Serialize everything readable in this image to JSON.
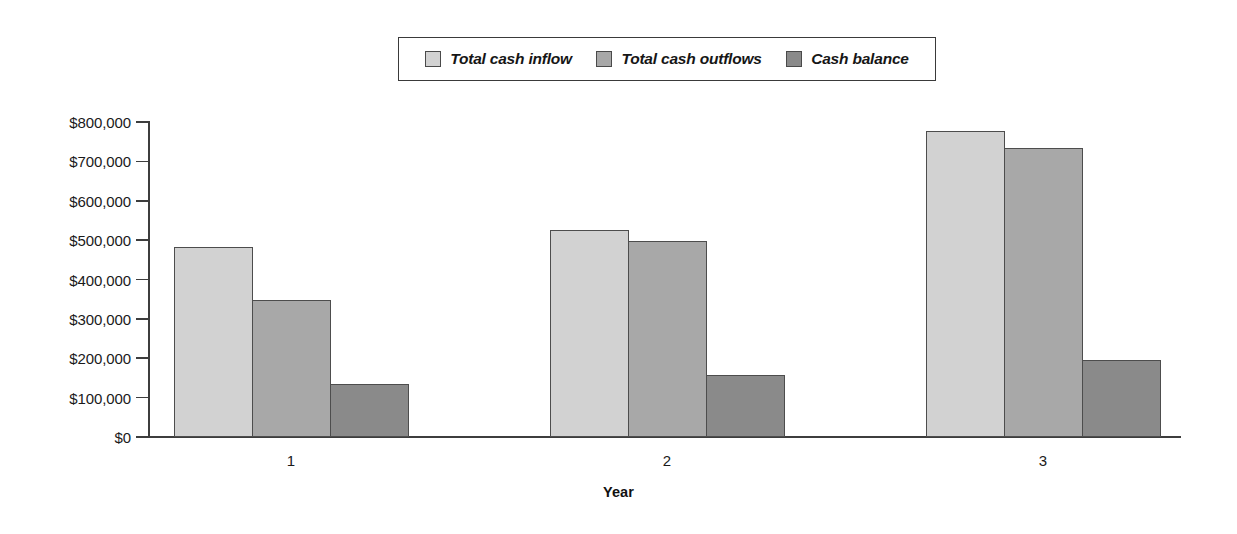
{
  "chart_data": {
    "type": "bar",
    "title": "",
    "xlabel": "Year",
    "ylabel": "",
    "categories": [
      "1",
      "2",
      "3"
    ],
    "series": [
      {
        "name": "Total cash inflow",
        "color": "#d2d2d2",
        "values": [
          483000,
          527000,
          778000
        ]
      },
      {
        "name": "Total cash outflows",
        "color": "#a8a8a8",
        "values": [
          348000,
          498000,
          734000
        ]
      },
      {
        "name": "Cash balance",
        "color": "#8a8a8a",
        "values": [
          134000,
          157000,
          196000
        ]
      }
    ],
    "ylim": [
      0,
      800000
    ],
    "ytick_values": [
      0,
      100000,
      200000,
      300000,
      400000,
      500000,
      600000,
      700000,
      800000
    ],
    "ytick_labels": [
      "$0",
      "$100,000",
      "$200,000",
      "$300,000",
      "$400,000",
      "$500,000",
      "$600,000",
      "$700,000",
      "$800,000"
    ],
    "grid": false,
    "legend_position": "top-center",
    "bar_gap_within_group": 0
  },
  "legend": {
    "entries": [
      {
        "label": "Total cash inflow",
        "swatch_color": "#d2d2d2"
      },
      {
        "label": "Total cash outflows",
        "swatch_color": "#a8a8a8"
      },
      {
        "label": "Cash balance",
        "swatch_color": "#8a8a8a"
      }
    ]
  },
  "axes": {
    "x_title": "Year",
    "x_tick_labels": [
      "1",
      "2",
      "3"
    ],
    "y_tick_labels": [
      "$800,000",
      "$700,000",
      "$600,000",
      "$500,000",
      "$400,000",
      "$300,000",
      "$200,000",
      "$100,000",
      "$0"
    ]
  }
}
